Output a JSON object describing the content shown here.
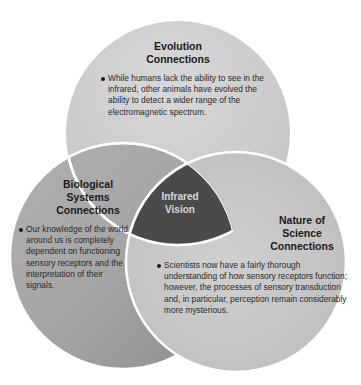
{
  "diagram": {
    "type": "venn-3",
    "center": {
      "label_line1": "Infrared",
      "label_line2": "Vision"
    },
    "circles": [
      {
        "id": "evolution",
        "title_line1": "Evolution",
        "title_line2": "Connections",
        "bullet": "While humans lack the ability to see in the infrared, other animals have evolved the ability to detect a wider range of the electromagnetic spectrum.",
        "fill": "#cfcfcf"
      },
      {
        "id": "biological",
        "title_line1": "Biological",
        "title_line2": "Systems",
        "title_line3": "Connections",
        "bullet": "Our knowledge of the world around us is completely dependent on functioning sensory receptors and the interpretation of their signals.",
        "fill": "#a3a3a3"
      },
      {
        "id": "nature-of-science",
        "title_line1": "Nature of",
        "title_line2": "Science",
        "title_line3": "Connections",
        "bullet": "Scientists now have a fairly thorough understanding of how sensory receptors function; however, the processes of sensory transduction and, in particular, perception remain considerably more mysterious.",
        "fill": "#c6c6c6"
      }
    ],
    "colors": {
      "center_fill": "#4a4a4a",
      "border": "#ffffff",
      "center_text": "#d9d9d9"
    }
  }
}
